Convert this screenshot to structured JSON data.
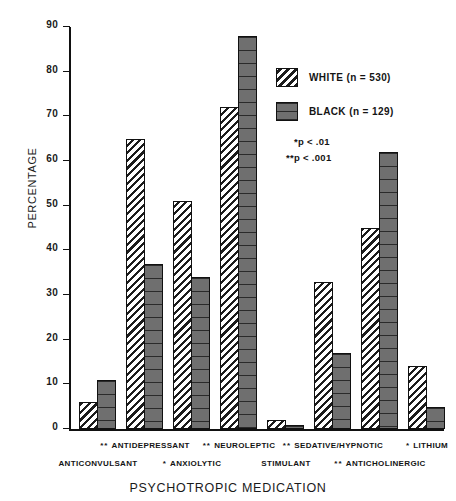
{
  "chart_data": {
    "type": "bar",
    "title": "",
    "xlabel": "PSYCHOTROPIC MEDICATION",
    "ylabel": "PERCENTAGE",
    "ylim": [
      0,
      90
    ],
    "yticks": [
      0,
      10,
      20,
      30,
      40,
      50,
      60,
      70,
      80,
      90
    ],
    "grid": false,
    "legend_position": "upper-right",
    "categories": [
      "ANTICONVULSANT",
      "ANTIDEPRESSANT",
      "ANXIOLYTIC",
      "NEUROLEPTIC",
      "STIMULANT",
      "SEDATIVE/HYPNOTIC",
      "ANTICHOLINERGIC",
      "LITHIUM"
    ],
    "significance": [
      "",
      "**",
      "*",
      "**",
      "",
      "**",
      "**",
      "*"
    ],
    "series": [
      {
        "name": "WHITE (n = 530)",
        "values": [
          6,
          65,
          51,
          72,
          2,
          33,
          45,
          14
        ]
      },
      {
        "name": "BLACK (n = 129)",
        "values": [
          11,
          37,
          34,
          88,
          1,
          17,
          62,
          5
        ]
      }
    ],
    "annotations": [
      "*p < .01",
      "**p < .001"
    ]
  },
  "legend": {
    "items": [
      {
        "label": "WHITE (n = 530)",
        "swatch": "diagonal-hatch"
      },
      {
        "label": "BLACK (n = 129)",
        "swatch": "solid-dark"
      }
    ],
    "notes": [
      "*p < .01",
      "**p < .001"
    ]
  },
  "axes": {
    "y_title": "PERCENTAGE",
    "x_title": "PSYCHOTROPIC MEDICATION",
    "y_tick_labels": [
      "0",
      "10",
      "20",
      "30",
      "40",
      "50",
      "60",
      "70",
      "80",
      "90"
    ]
  },
  "x_labels_row_top": [
    {
      "stars": "**",
      "text": "ANTIDEPRESSANT"
    },
    {
      "stars": "**",
      "text": "NEUROLEPTIC"
    },
    {
      "stars": "**",
      "text": "SEDATIVE/HYPNOTIC"
    },
    {
      "stars": "*",
      "text": "LITHIUM"
    }
  ],
  "x_labels_row_bottom": [
    {
      "stars": "",
      "text": "ANTICONVULSANT"
    },
    {
      "stars": "*",
      "text": "ANXIOLYTIC"
    },
    {
      "stars": "",
      "text": "STIMULANT"
    },
    {
      "stars": "**",
      "text": "ANTICHOLINERGIC"
    }
  ],
  "colors": {
    "axis": "#111111",
    "white_series": "#ffffff",
    "black_series": "#6f6f6f",
    "text": "#141414"
  }
}
